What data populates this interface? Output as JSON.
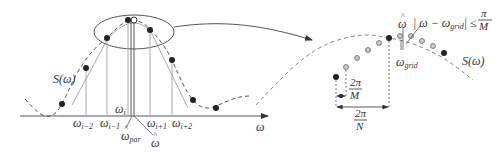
{
  "left_panel": {
    "curve_label": "S(ω)",
    "axis_label": "ω",
    "labels": {
      "w_i": "ω",
      "w_i_sub": "i",
      "w_im2": "ω",
      "w_im2_sub": "i−2",
      "w_im1": "ω",
      "w_im1_sub": "i−1",
      "w_ip1": "ω",
      "w_ip1_sub": "i+1",
      "w_ip2": "ω",
      "w_ip2_sub": "i+2",
      "w_par": "ω",
      "w_par_sub": "par",
      "w_hat": "ω",
      "hat": "^"
    }
  },
  "right_panel": {
    "curve_label": "S(ω)",
    "w_hat": "ω",
    "hat": "^",
    "w_grid": "ω",
    "w_grid_sub": "grid",
    "inequality_left": "| ω − ω",
    "inequality_sub": "grid",
    "inequality_right": "| ≤",
    "pi": "π",
    "M": "M",
    "two_pi": "2π",
    "N": "N"
  }
}
